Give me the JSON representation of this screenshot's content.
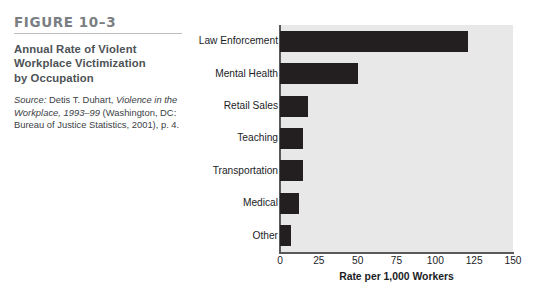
{
  "figure": {
    "number_label": "FIGURE 10–3",
    "title_line_1": "Annual Rate of Violent",
    "title_line_2": "Workplace Victimization",
    "title_line_3": "by Occupation",
    "source_prefix": "Source:",
    "source_author": " Detis T. Duhart, ",
    "source_work": "Violence in the Workplace, 1993–99",
    "source_publisher": " (Washington, DC: Bureau of Justice Statistics, 2001), p. 4.",
    "accent_rule_color": "#b9bdc1",
    "number_color": "#7b7f83",
    "title_color": "#4d5256"
  },
  "chart_data": {
    "type": "bar",
    "orientation": "horizontal",
    "title": "Annual Rate of Violent Workplace Victimization by Occupation",
    "categories": [
      "Law Enforcement",
      "Mental Health",
      "Retail Sales",
      "Teaching",
      "Transportation",
      "Medical",
      "Other"
    ],
    "values": [
      121,
      50,
      18,
      15,
      15,
      12,
      7
    ],
    "xlabel": "Rate per 1,000 Workers",
    "ylabel": "",
    "xlim": [
      0,
      150
    ],
    "xticks": [
      0,
      25,
      50,
      75,
      100,
      125,
      150
    ],
    "xtick_labels": [
      "0",
      "25",
      "50",
      "75",
      "100",
      "125",
      "150"
    ],
    "grid": false,
    "legend": null,
    "bar_color": "#231f20",
    "plot_background": "#e8e8e8",
    "axis_color": "#58595b"
  }
}
